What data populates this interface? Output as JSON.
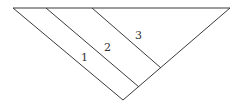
{
  "diagram": {
    "triangle": {
      "left_vertex": [
        13,
        8
      ],
      "right_vertex": [
        230,
        8
      ],
      "bottom_vertex": [
        123,
        100
      ]
    },
    "dividers": [
      {
        "from": [
          46,
          8
        ],
        "to": [
          139,
          87
        ]
      },
      {
        "from": [
          92,
          8
        ],
        "to": [
          161,
          68
        ]
      }
    ],
    "regions": [
      {
        "label": "1",
        "pos": [
          84,
          60
        ]
      },
      {
        "label": "2",
        "pos": [
          107,
          50
        ]
      },
      {
        "label": "3",
        "pos": [
          138,
          38
        ]
      }
    ],
    "colors": {
      "line": "#3a3a3a",
      "text": "#333333",
      "background": "#ffffff"
    }
  }
}
